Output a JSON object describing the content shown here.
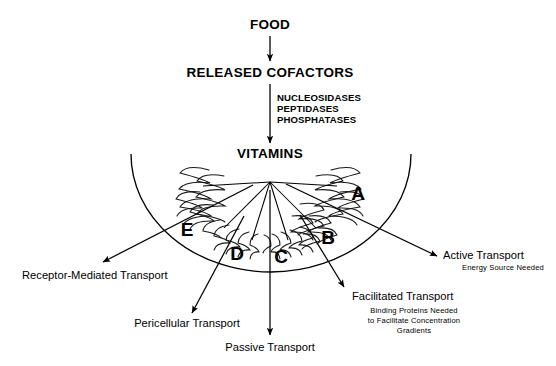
{
  "diagram": {
    "title_nodes": {
      "food": "FOOD",
      "released_cofactors": "RELEASED COFACTORS",
      "vitamins": "VITAMINS"
    },
    "enzymes": {
      "line1": "NUCLEOSIDASES",
      "line2": "PEPTIDASES",
      "line3": "PHOSPHATASES"
    },
    "region_letters": {
      "a": "A",
      "b": "B",
      "c": "C",
      "d": "D",
      "e": "E"
    },
    "transport_labels": {
      "active": {
        "name": "Active Transport",
        "detail": "Energy Source Needed"
      },
      "facilitated": {
        "name": "Facilitated Transport",
        "detail_line1": "Binding Proteins Needed",
        "detail_line2": "to Facilitate Concentration",
        "detail_line3": "Gradients"
      },
      "passive": {
        "name": "Passive Transport"
      },
      "pericellular": {
        "name": "Pericellular Transport"
      },
      "receptor": {
        "name": "Receptor-Mediated Transport"
      }
    },
    "colors": {
      "ink": "#000000",
      "background": "#ffffff"
    }
  }
}
